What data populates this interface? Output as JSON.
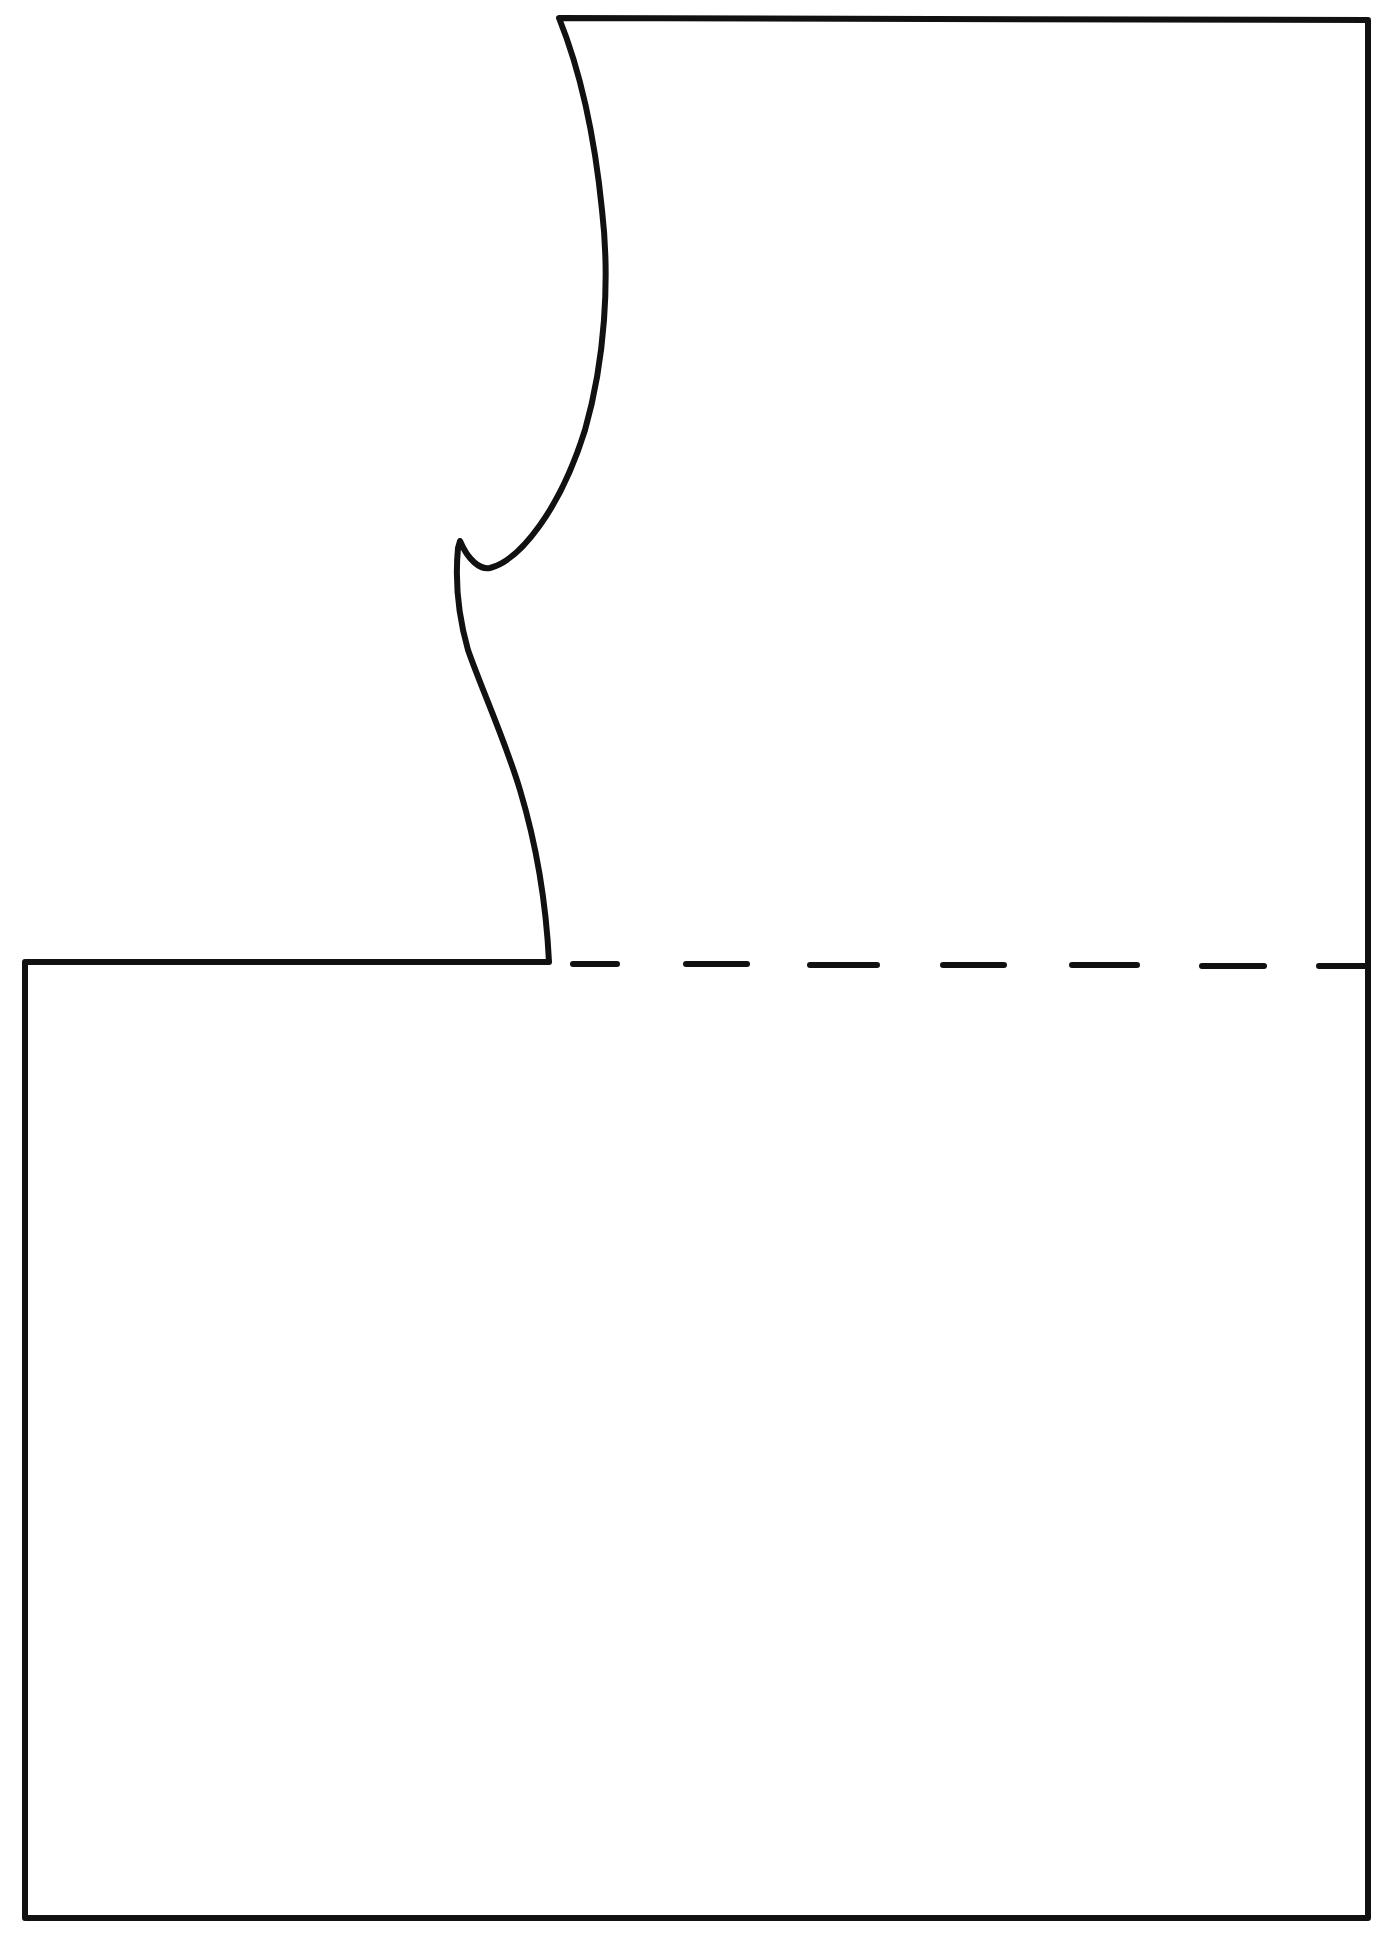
{
  "diagram": {
    "type": "pattern-piece-outline",
    "colors": {
      "background": "#ffffff",
      "stroke": "#111111"
    },
    "stroke_width": 6,
    "dashed_line": {
      "y": 965,
      "x_start": 573,
      "x_end": 1368,
      "dash_count": 7
    },
    "labels": []
  }
}
